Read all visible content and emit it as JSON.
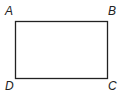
{
  "diagram": {
    "type": "rectangle",
    "stroke_color": "#222222",
    "vertices": [
      {
        "label": "A",
        "position": "top-left"
      },
      {
        "label": "B",
        "position": "top-right"
      },
      {
        "label": "C",
        "position": "bottom-right"
      },
      {
        "label": "D",
        "position": "bottom-left"
      }
    ]
  }
}
